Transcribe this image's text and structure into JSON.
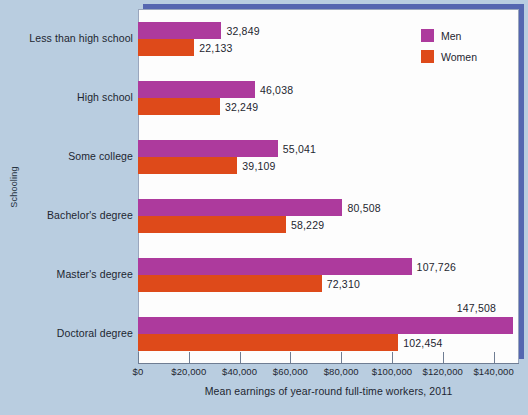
{
  "chart_data": {
    "type": "bar",
    "orientation": "horizontal",
    "title": "",
    "xlabel": "Mean earnings of year-round full-time workers, 2011",
    "ylabel": "Schooling",
    "categories": [
      "Less than high school",
      "High school",
      "Some college",
      "Bachelor's degree",
      "Master's degree",
      "Doctoral degree"
    ],
    "series": [
      {
        "name": "Men",
        "color": "#ad3a9d",
        "values": [
          32849,
          46038,
          55041,
          80508,
          107726,
          147508
        ],
        "labels": [
          "32,849",
          "46,038",
          "55,041",
          "80,508",
          "107,726",
          "147,508"
        ]
      },
      {
        "name": "Women",
        "color": "#de4a1a",
        "values": [
          22133,
          32249,
          39109,
          58229,
          72310,
          102454
        ],
        "labels": [
          "22,133",
          "32,249",
          "39,109",
          "58,229",
          "72,310",
          "102,454"
        ]
      }
    ],
    "xlim": [
      0,
      150000
    ],
    "xticks": [
      0,
      20000,
      40000,
      60000,
      80000,
      100000,
      120000,
      140000
    ],
    "xtick_labels": [
      "$0",
      "$20,000",
      "$40,000",
      "$60,000",
      "$80,000",
      "$100,000",
      "$120,000",
      "$140,000"
    ],
    "grid": false,
    "legend_position": "top-right"
  },
  "legend": {
    "entries": [
      {
        "label": "Men",
        "color": "#ad3a9d"
      },
      {
        "label": "Women",
        "color": "#de4a1a"
      }
    ]
  },
  "colors": {
    "background": "#b9cde0",
    "panel": "#fdfdfd",
    "shadow": "#5566b0",
    "men": "#ad3a9d",
    "women": "#de4a1a",
    "text": "#1d2630",
    "axis": "#6f7d93"
  }
}
